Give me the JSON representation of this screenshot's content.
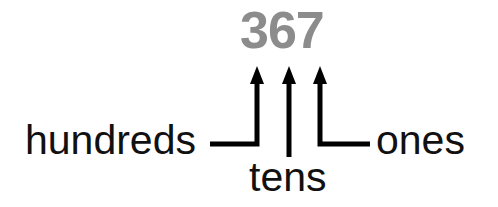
{
  "diagram": {
    "number": "367",
    "digits": [
      {
        "digit": "3",
        "place": "hundreds"
      },
      {
        "digit": "6",
        "place": "tens"
      },
      {
        "digit": "7",
        "place": "ones"
      }
    ],
    "labels": {
      "hundreds": "hundreds",
      "tens": "tens",
      "ones": "ones"
    },
    "colors": {
      "number": "#8c8c8c",
      "text": "#111111",
      "arrows": "#000000"
    }
  }
}
